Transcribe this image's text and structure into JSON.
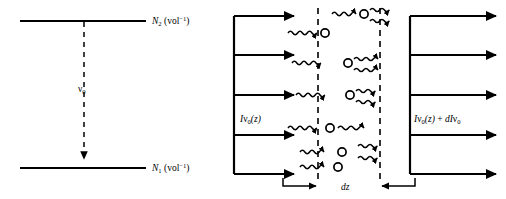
{
  "figure": {
    "background_color": "#ffffff",
    "stroke_color": "#000000"
  },
  "left_panel": {
    "name": "two-level-energy-diagram",
    "upper_level": {
      "symbol": "N",
      "subscript": "2",
      "units": "(vol",
      "units_exponent": "−1",
      "units_close": ")",
      "full_label": "N2 (vol-1)"
    },
    "lower_level": {
      "symbol": "N",
      "subscript": "1",
      "units": "(vol",
      "units_exponent": "−1",
      "units_close": ")",
      "full_label": "N1 (vol-1)"
    },
    "transition": {
      "symbol": "ν",
      "subscript": "0",
      "full_label": "ν0",
      "style": "dashed-downward-arrow"
    }
  },
  "right_panel": {
    "name": "photon-flux-slab-diagram",
    "input_flux": {
      "italic_i": "I",
      "nu": "ν",
      "subscript": "0",
      "argument": "(z)",
      "full_label": "Iν0(z)"
    },
    "output_flux": {
      "italic_i": "I",
      "nu": "ν",
      "subscript": "0",
      "argument": "(z)",
      "plus": "+",
      "d_italic": "d",
      "d_i": "I",
      "d_nu": "ν",
      "d_subscript": "0",
      "full_label": "Iν0(z) + dIν0"
    },
    "thickness_label": {
      "italic_d": "d",
      "italic_z": "z",
      "full_label": "dz"
    },
    "input_arrow_count": 5,
    "output_arrow_count": 5,
    "atom_count": 6,
    "slab_boundary_style": "dashed-vertical"
  }
}
